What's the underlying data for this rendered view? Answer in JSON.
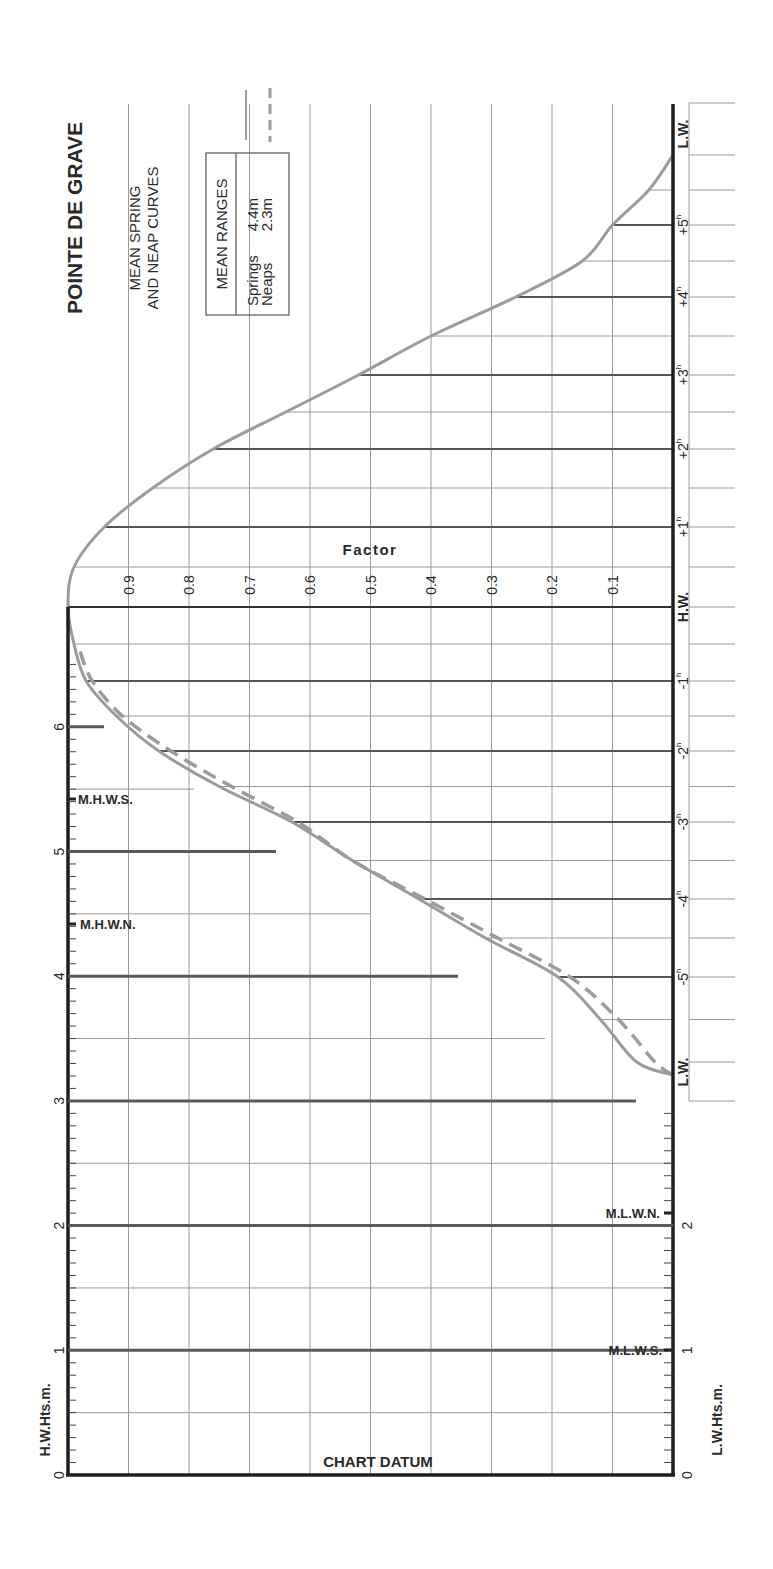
{
  "title": "POINTE DE GRAVE",
  "subtitle_line1": "MEAN SPRING",
  "subtitle_line2": "AND NEAP CURVES",
  "legend": {
    "header": "MEAN RANGES",
    "springs_label": "Springs",
    "springs_value": "4.4m",
    "neaps_label": "Neaps",
    "neaps_value": "2.3m"
  },
  "axes": {
    "factor_label": "Factor",
    "hw_heights_label": "H.W.Hts.m.",
    "lw_heights_label": "L.W.Hts.m.",
    "chart_datum_label": "CHART DATUM",
    "hw_label": "H.W.",
    "lw_label": "L.W."
  },
  "markers": {
    "mhws": "M.H.W.S.",
    "mhwn": "M.H.W.N.",
    "mlwn": "M.L.W.N.",
    "mlws": "M.L.W.S."
  },
  "colors": {
    "curve": "#9b9b9b",
    "axis": "#1e1e1e",
    "grid": "#9a9a9a"
  },
  "chart_data": {
    "type": "line",
    "xlabel": "Time from H.W. (hours)",
    "ylabel": "Factor",
    "x_ticks": [
      "L.W.",
      "-5h",
      "-4h",
      "-3h",
      "-2h",
      "-1h",
      "H.W.",
      "+1h",
      "+2h",
      "+3h",
      "+4h",
      "+5h",
      "L.W."
    ],
    "factor_ticks": [
      "0.1",
      "0.2",
      "0.3",
      "0.4",
      "0.5",
      "0.6",
      "0.7",
      "0.8",
      "0.9"
    ],
    "height_ticks": [
      "0",
      "1",
      "2",
      "3",
      "4",
      "5",
      "6"
    ],
    "ylim": [
      0,
      1
    ],
    "grid": true,
    "series": [
      {
        "name": "Springs (4.4m)",
        "style": "solid",
        "x": [
          -6.2,
          -6,
          -5.5,
          -5,
          -4.5,
          -4,
          -3.5,
          -3,
          -2.5,
          -2,
          -1.5,
          -1,
          -0.5,
          0,
          0.5,
          1,
          1.5,
          2,
          2.5,
          3,
          3.5,
          4,
          4.5,
          5,
          5.5,
          6
        ],
        "values": [
          0.0,
          0.06,
          0.12,
          0.19,
          0.31,
          0.42,
          0.53,
          0.63,
          0.75,
          0.85,
          0.92,
          0.97,
          0.99,
          1.0,
          0.99,
          0.94,
          0.86,
          0.76,
          0.64,
          0.52,
          0.4,
          0.26,
          0.15,
          0.1,
          0.04,
          0.0
        ]
      },
      {
        "name": "Neaps (2.3m)",
        "style": "dashed",
        "x": [
          -6.2,
          -6,
          -5.5,
          -5,
          -4.5,
          -4,
          -3.5,
          -3,
          -2.5,
          -2,
          -1.5,
          -1,
          -0.6
        ],
        "values": [
          0.0,
          0.03,
          0.09,
          0.17,
          0.29,
          0.41,
          0.53,
          0.62,
          0.73,
          0.83,
          0.91,
          0.96,
          0.98
        ]
      }
    ],
    "height_levels": {
      "MHWS": 5.4,
      "MHWN": 4.4,
      "MLWN": 2.1,
      "MLWS": 1.0
    },
    "mean_ranges": {
      "Springs": "4.4m",
      "Neaps": "2.3m"
    }
  }
}
